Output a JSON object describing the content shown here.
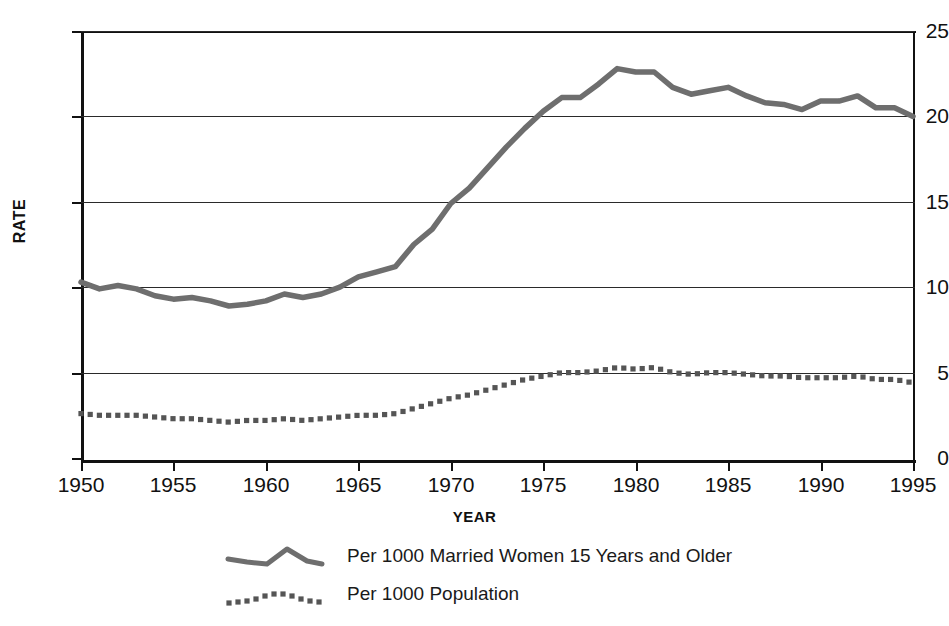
{
  "chart_data": {
    "type": "line",
    "title": "",
    "xlabel": "YEAR",
    "ylabel": "RATE",
    "xlim": [
      1950,
      1995
    ],
    "ylim": [
      0,
      25
    ],
    "grid": true,
    "legend_position": "bottom",
    "x_ticks": [
      "1950",
      "1955",
      "1960",
      "1965",
      "1970",
      "1975",
      "1980",
      "1985",
      "1990",
      "1995"
    ],
    "y_ticks": [
      "0",
      "5",
      "10",
      "15",
      "20",
      "25"
    ],
    "x": [
      1950,
      1951,
      1952,
      1953,
      1954,
      1955,
      1956,
      1957,
      1958,
      1959,
      1960,
      1961,
      1962,
      1963,
      1964,
      1965,
      1966,
      1967,
      1968,
      1969,
      1970,
      1971,
      1972,
      1973,
      1974,
      1975,
      1976,
      1977,
      1978,
      1979,
      1980,
      1981,
      1982,
      1983,
      1984,
      1985,
      1986,
      1987,
      1988,
      1989,
      1990,
      1991,
      1992,
      1993,
      1994,
      1995
    ],
    "series": [
      {
        "name": "Per 1000 Married Women 15 Years and Older",
        "style": "solid",
        "color": "#6e6e6e",
        "values": [
          10.3,
          9.9,
          10.1,
          9.9,
          9.5,
          9.3,
          9.4,
          9.2,
          8.9,
          9.0,
          9.2,
          9.6,
          9.4,
          9.6,
          10.0,
          10.6,
          10.9,
          11.2,
          12.5,
          13.4,
          14.9,
          15.8,
          17.0,
          18.2,
          19.3,
          20.3,
          21.1,
          21.1,
          21.9,
          22.8,
          22.6,
          22.6,
          21.7,
          21.3,
          21.5,
          21.7,
          21.2,
          20.8,
          20.7,
          20.4,
          20.9,
          20.9,
          21.2,
          20.5,
          20.5,
          20.0
        ]
      },
      {
        "name": "Per 1000 Population",
        "style": "dotted",
        "color": "#555555",
        "values": [
          2.6,
          2.5,
          2.5,
          2.5,
          2.4,
          2.3,
          2.3,
          2.2,
          2.1,
          2.2,
          2.2,
          2.3,
          2.2,
          2.3,
          2.4,
          2.5,
          2.5,
          2.6,
          2.9,
          3.2,
          3.5,
          3.7,
          4.0,
          4.3,
          4.6,
          4.8,
          5.0,
          5.0,
          5.1,
          5.3,
          5.2,
          5.3,
          5.0,
          4.9,
          5.0,
          5.0,
          4.9,
          4.8,
          4.8,
          4.7,
          4.7,
          4.7,
          4.8,
          4.6,
          4.6,
          4.4
        ]
      }
    ]
  },
  "axes": {
    "y_title": "RATE",
    "x_title": "YEAR",
    "y_tick_labels": [
      "25",
      "20",
      "15",
      "10",
      "5",
      "0"
    ],
    "x_tick_labels": [
      "1950",
      "1955",
      "1960",
      "1965",
      "1970",
      "1975",
      "1980",
      "1985",
      "1990",
      "1995"
    ]
  },
  "legend": {
    "entries": [
      {
        "label": "Per 1000 Married Women 15 Years and Older",
        "style": "solid",
        "swatch": "solid-line-swatch"
      },
      {
        "label": "Per 1000 Population",
        "style": "dotted",
        "swatch": "dotted-line-swatch"
      }
    ]
  },
  "colors": {
    "solid_series": "#6e6e6e",
    "dotted_series": "#555555",
    "axis": "#111111",
    "gridline": "#2a2a2a",
    "background": "#ffffff"
  }
}
